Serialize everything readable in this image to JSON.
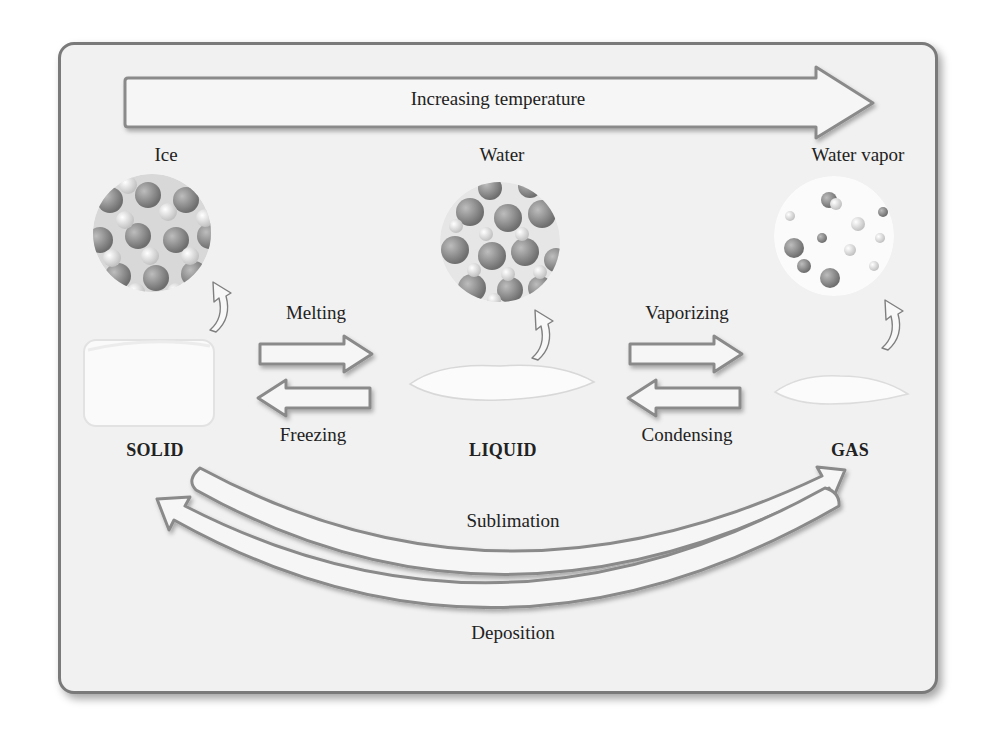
{
  "diagram": {
    "title_arrow_label": "Increasing temperature",
    "substances": [
      {
        "name": "Ice",
        "state": "SOLID"
      },
      {
        "name": "Water",
        "state": "LIQUID"
      },
      {
        "name": "Water vapor",
        "state": "GAS"
      }
    ],
    "transitions": {
      "melting": "Melting",
      "freezing": "Freezing",
      "vaporizing": "Vaporizing",
      "condensing": "Condensing",
      "sublimation": "Sublimation",
      "deposition": "Deposition"
    },
    "colors": {
      "panel_background": "#f1f1f1",
      "panel_border": "#7a7a7a",
      "arrow_fill": "#f6f6f6",
      "arrow_stroke": "#8a8a8a",
      "text": "#222222"
    }
  }
}
